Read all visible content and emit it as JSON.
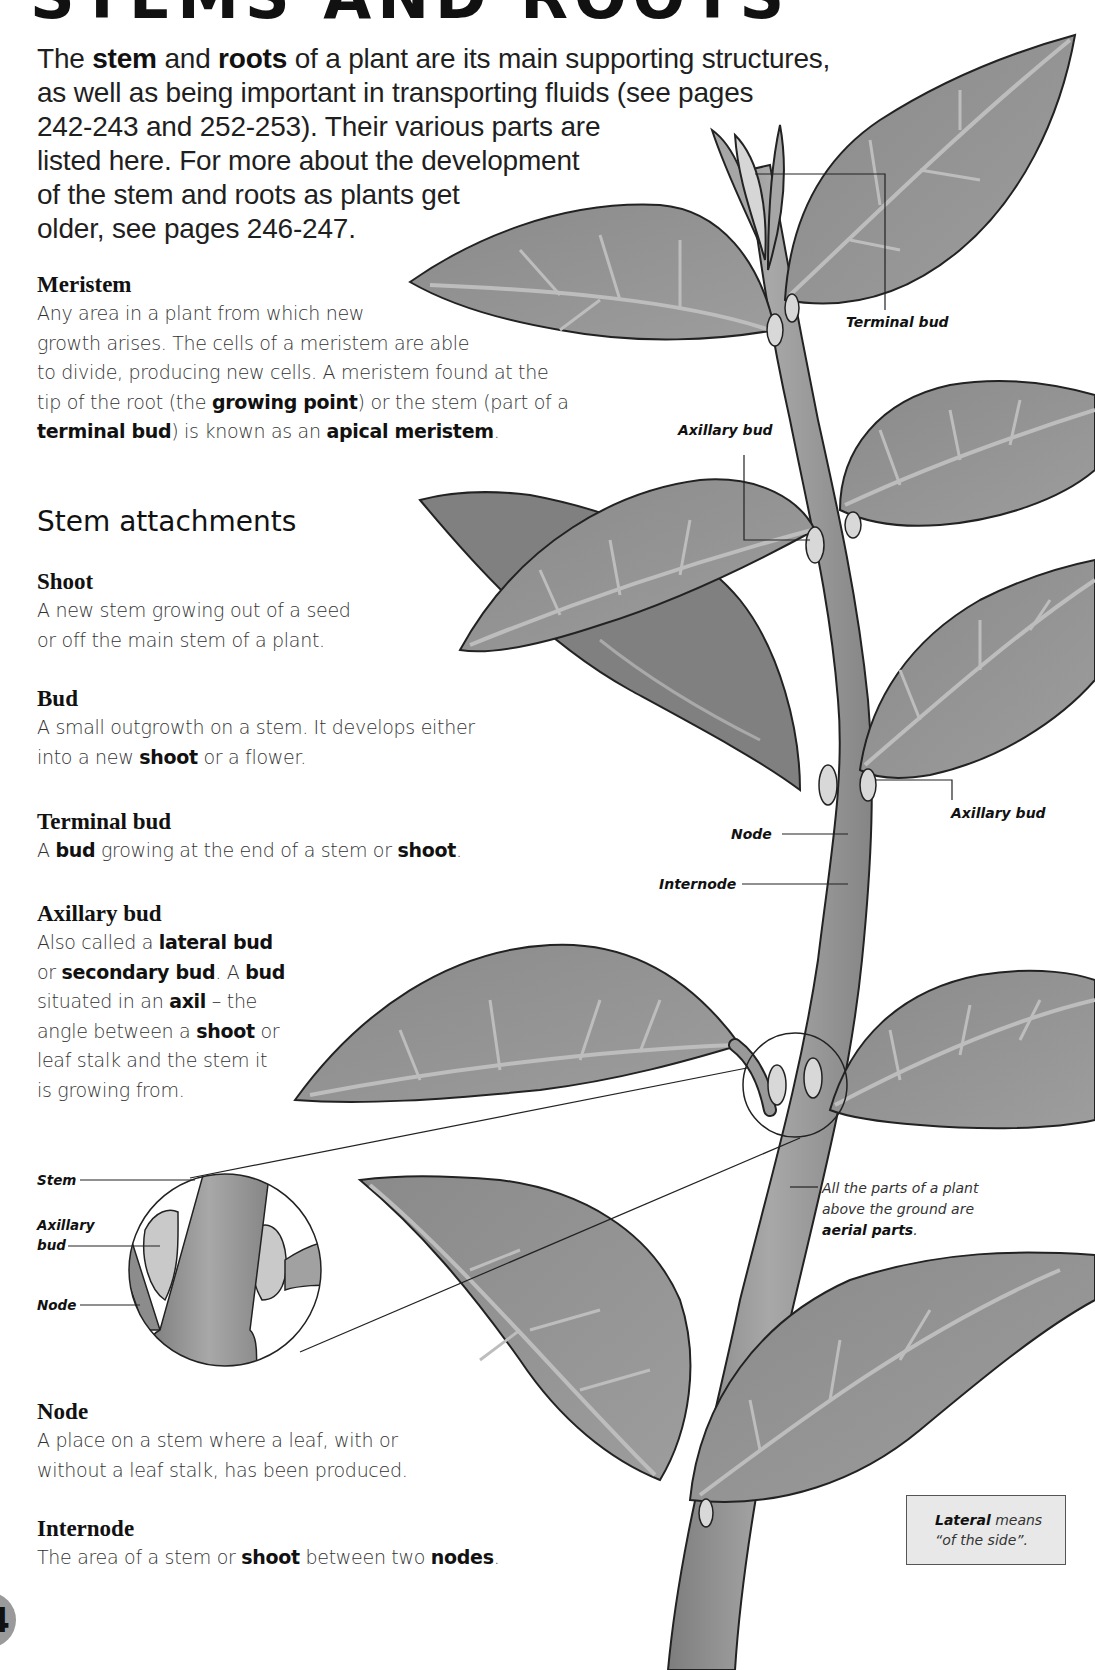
{
  "page": {
    "heading": "STEMS AND ROOTS",
    "page_number": "4"
  },
  "intro": {
    "lines": [
      [
        "The ",
        "stem",
        " and ",
        "roots",
        " of a plant are its main supporting structures,"
      ],
      [
        "as well as being important in transporting fluids (see pages"
      ],
      [
        "242-243 and 252-253). Their various parts are"
      ],
      [
        "listed here. For more about the development"
      ],
      [
        "of the stem and roots as plants get"
      ],
      [
        "older, see pages 246-247."
      ]
    ],
    "line1": {
      "a": "The ",
      "b": "stem",
      "c": " and ",
      "d": "roots",
      "e": " of a plant are its main supporting structures,"
    },
    "line2": "as well as being important in transporting fluids (see pages",
    "line3": "242-243 and 252-253). Their various parts are",
    "line4": "listed here. For more about the development",
    "line5": "of the stem and roots as plants get",
    "line6": "older, see pages 246-247."
  },
  "meristem": {
    "title": "Meristem",
    "l1": "Any area in a plant from which new",
    "l2": "growth arises. The cells of a meristem are able",
    "l3": "to divide, producing new cells. A meristem found at the",
    "l4a": "tip of the root (the ",
    "l4b": "growing point",
    "l4c": ") or the stem (part of a",
    "l5a": "terminal bud",
    "l5b": ") is known as an ",
    "l5c": "apical meristem",
    "l5d": "."
  },
  "section": {
    "title": "Stem attachments"
  },
  "terms": {
    "shoot": {
      "title": "Shoot",
      "l1": "A new stem growing out of a seed",
      "l2": "or off the main stem of a plant."
    },
    "bud": {
      "title": "Bud",
      "l1": "A small outgrowth on a stem. It develops either",
      "l2a": "into a new ",
      "l2b": "shoot",
      "l2c": " or a flower."
    },
    "terminal_bud": {
      "title": "Terminal bud",
      "l1a": "A ",
      "l1b": "bud",
      "l1c": " growing at the end of a stem or ",
      "l1d": "shoot",
      "l1e": "."
    },
    "axillary_bud": {
      "title": "Axillary bud",
      "l1a": "Also called a ",
      "l1b": "lateral bud",
      "l2a": "or ",
      "l2b": "secondary bud",
      "l2c": ". A ",
      "l2d": "bud",
      "l3a": "situated in an ",
      "l3b": "axil",
      "l3c": " – the",
      "l4a": "angle between a ",
      "l4b": "shoot",
      "l4c": " or",
      "l5": "leaf stalk and the stem it",
      "l6": "is growing from."
    },
    "node": {
      "title": "Node",
      "l1": "A place on a stem where a leaf, with or",
      "l2": "without a leaf stalk, has been produced."
    },
    "internode": {
      "title": "Internode",
      "l1a": "The area of a stem or ",
      "l1b": "shoot",
      "l1c": " between two ",
      "l1d": "nodes",
      "l1e": "."
    }
  },
  "diagram_labels": {
    "terminal_bud": "Terminal bud",
    "axillary_bud_top": "Axillary bud",
    "axillary_bud_right": "Axillary bud",
    "node": "Node",
    "internode": "Internode",
    "inset_stem": "Stem",
    "inset_axillary_1": "Axillary",
    "inset_axillary_2": "bud",
    "inset_node": "Node"
  },
  "caption": {
    "l1": "All the parts of a plant",
    "l2": "above the ground are",
    "l3a": "aerial parts",
    "l3b": "."
  },
  "note": {
    "l1a": "Lateral",
    "l1b": " means",
    "l2": "“of the side”."
  },
  "colors": {
    "leaf_fill": "#8f8f8f",
    "leaf_vein": "#b8b8b8",
    "stem_fill": "#9c9c9c",
    "bud_fill": "#d9d9d9",
    "outline": "#222222",
    "note_bg": "#e8e8e8",
    "badge": "#9a9a9a"
  }
}
